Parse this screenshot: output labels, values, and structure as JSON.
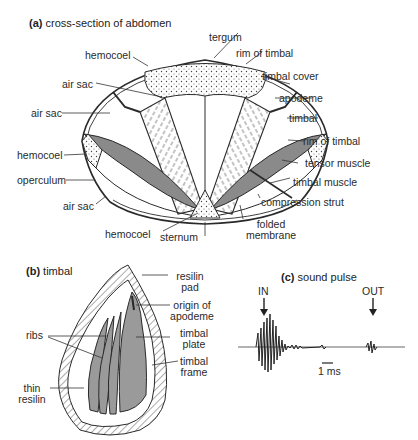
{
  "panel_a": {
    "tag": "(a)",
    "title": "cross-section of abdomen",
    "labels": {
      "tergum": "tergum",
      "rim_of_timbal_top": "rim of timbal",
      "hemocoel_top": "hemocoel",
      "timbal_cover": "timbal cover",
      "air_sac_upper": "air sac",
      "apodeme": "apodeme",
      "air_sac_left": "air sac",
      "timbal": "timbal",
      "rim_of_timbal_right": "rim of timbal",
      "hemocoel_left": "hemocoel",
      "tensor_muscle": "tensor muscle",
      "operculum": "operculum",
      "timbal_muscle": "timbal muscle",
      "compression_strut": "compression strut",
      "air_sac_lower": "air sac",
      "hemocoel_bottom": "hemocoel",
      "sternum": "sternum",
      "folded_membrane_1": "folded",
      "folded_membrane_2": "membrane"
    }
  },
  "panel_b": {
    "tag": "(b)",
    "title": "timbal",
    "labels": {
      "resilin_pad_1": "resilin",
      "resilin_pad_2": "pad",
      "origin_of_apodeme_1": "origin of",
      "origin_of_apodeme_2": "apodeme",
      "ribs": "ribs",
      "timbal_plate_1": "timbal",
      "timbal_plate_2": "plate",
      "timbal_frame_1": "timbal",
      "timbal_frame_2": "frame",
      "thin_resilin_1": "thin",
      "thin_resilin_2": "resilin"
    }
  },
  "panel_c": {
    "tag": "(c)",
    "title": "sound pulse",
    "in_label": "IN",
    "out_label": "OUT",
    "scale_label": "1 ms"
  },
  "colors": {
    "line": "#2a2a2a",
    "muscle_shade": "#8a8a8a",
    "plate_shade": "#9a9a9a",
    "background": "#ffffff"
  }
}
